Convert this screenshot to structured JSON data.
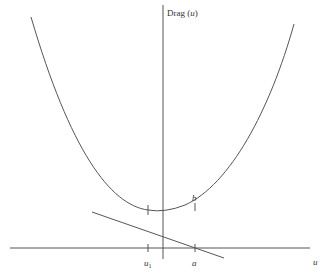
{
  "diagram": {
    "y_axis_label": "Drag",
    "y_axis_arg": "u",
    "x_axis_label": "u",
    "tick_labels": {
      "u1_base": "u",
      "u1_sub": "1",
      "a": "a",
      "b": "b"
    },
    "colors": {
      "line": "#555555",
      "text": "#333333",
      "background": "#ffffff"
    }
  }
}
